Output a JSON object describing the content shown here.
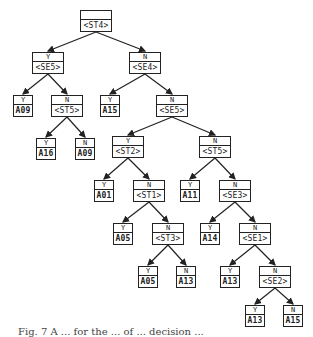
{
  "tree": {
    "nodes": [
      {
        "id": "n0",
        "branch": "",
        "value": "<ST4>",
        "type": "test",
        "x": 80,
        "y": 10,
        "w": 32,
        "h": 22
      },
      {
        "id": "n1",
        "branch": "Y",
        "value": "<SE5>",
        "type": "test",
        "x": 32,
        "y": 52,
        "w": 32,
        "h": 22
      },
      {
        "id": "n2",
        "branch": "N",
        "value": "<SE4>",
        "type": "test",
        "x": 129,
        "y": 52,
        "w": 32,
        "h": 22
      },
      {
        "id": "n3",
        "branch": "Y",
        "value": "A09",
        "type": "leaf",
        "x": 13,
        "y": 95,
        "w": 20,
        "h": 22
      },
      {
        "id": "n4",
        "branch": "N",
        "value": "<ST5>",
        "type": "test",
        "x": 51,
        "y": 95,
        "w": 32,
        "h": 22
      },
      {
        "id": "n5",
        "branch": "Y",
        "value": "A15",
        "type": "leaf",
        "x": 100,
        "y": 95,
        "w": 20,
        "h": 22
      },
      {
        "id": "n6",
        "branch": "N",
        "value": "<SE5>",
        "type": "test",
        "x": 156,
        "y": 95,
        "w": 32,
        "h": 22
      },
      {
        "id": "n7",
        "branch": "Y",
        "value": "A16",
        "type": "leaf",
        "x": 36,
        "y": 138,
        "w": 20,
        "h": 22
      },
      {
        "id": "n8",
        "branch": "N",
        "value": "A09",
        "type": "leaf",
        "x": 75,
        "y": 138,
        "w": 20,
        "h": 22
      },
      {
        "id": "n9",
        "branch": "Y",
        "value": "<ST2>",
        "type": "test",
        "x": 112,
        "y": 136,
        "w": 32,
        "h": 22
      },
      {
        "id": "n10",
        "branch": "N",
        "value": "<ST5>",
        "type": "test",
        "x": 199,
        "y": 136,
        "w": 32,
        "h": 22
      },
      {
        "id": "n11",
        "branch": "Y",
        "value": "A01",
        "type": "leaf",
        "x": 94,
        "y": 180,
        "w": 20,
        "h": 22
      },
      {
        "id": "n12",
        "branch": "N",
        "value": "<ST1>",
        "type": "test",
        "x": 133,
        "y": 180,
        "w": 32,
        "h": 22
      },
      {
        "id": "n13",
        "branch": "Y",
        "value": "A11",
        "type": "leaf",
        "x": 180,
        "y": 180,
        "w": 20,
        "h": 22
      },
      {
        "id": "n14",
        "branch": "N",
        "value": "<SE3>",
        "type": "test",
        "x": 219,
        "y": 180,
        "w": 32,
        "h": 22
      },
      {
        "id": "n15",
        "branch": "Y",
        "value": "A05",
        "type": "leaf",
        "x": 113,
        "y": 223,
        "w": 20,
        "h": 22
      },
      {
        "id": "n16",
        "branch": "N",
        "value": "<ST3>",
        "type": "test",
        "x": 152,
        "y": 223,
        "w": 32,
        "h": 22
      },
      {
        "id": "n17",
        "branch": "Y",
        "value": "A14",
        "type": "leaf",
        "x": 200,
        "y": 223,
        "w": 20,
        "h": 22
      },
      {
        "id": "n18",
        "branch": "N",
        "value": "<SE1>",
        "type": "test",
        "x": 239,
        "y": 223,
        "w": 32,
        "h": 22
      },
      {
        "id": "n19",
        "branch": "Y",
        "value": "A05",
        "type": "leaf",
        "x": 138,
        "y": 266,
        "w": 20,
        "h": 22
      },
      {
        "id": "n20",
        "branch": "N",
        "value": "A13",
        "type": "leaf",
        "x": 176,
        "y": 266,
        "w": 20,
        "h": 22
      },
      {
        "id": "n21",
        "branch": "Y",
        "value": "A13",
        "type": "leaf",
        "x": 220,
        "y": 266,
        "w": 20,
        "h": 22
      },
      {
        "id": "n22",
        "branch": "N",
        "value": "<SE2>",
        "type": "test",
        "x": 259,
        "y": 266,
        "w": 32,
        "h": 22
      },
      {
        "id": "n23",
        "branch": "Y",
        "value": "A13",
        "type": "leaf",
        "x": 245,
        "y": 305,
        "w": 20,
        "h": 22
      },
      {
        "id": "n24",
        "branch": "N",
        "value": "A15",
        "type": "leaf",
        "x": 283,
        "y": 305,
        "w": 20,
        "h": 22
      }
    ],
    "edges": [
      [
        "n0",
        "n1"
      ],
      [
        "n0",
        "n2"
      ],
      [
        "n1",
        "n3"
      ],
      [
        "n1",
        "n4"
      ],
      [
        "n2",
        "n5"
      ],
      [
        "n2",
        "n6"
      ],
      [
        "n4",
        "n7"
      ],
      [
        "n4",
        "n8"
      ],
      [
        "n6",
        "n9"
      ],
      [
        "n6",
        "n10"
      ],
      [
        "n9",
        "n11"
      ],
      [
        "n9",
        "n12"
      ],
      [
        "n10",
        "n13"
      ],
      [
        "n10",
        "n14"
      ],
      [
        "n12",
        "n15"
      ],
      [
        "n12",
        "n16"
      ],
      [
        "n14",
        "n17"
      ],
      [
        "n14",
        "n18"
      ],
      [
        "n16",
        "n19"
      ],
      [
        "n16",
        "n20"
      ],
      [
        "n18",
        "n21"
      ],
      [
        "n18",
        "n22"
      ],
      [
        "n22",
        "n23"
      ],
      [
        "n22",
        "n24"
      ]
    ]
  },
  "caption": "Fig. 7  A ... for the ... of ... decision ..."
}
